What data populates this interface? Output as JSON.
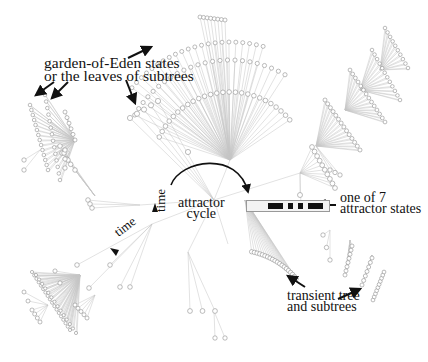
{
  "figure": {
    "type": "basin-of-attraction field (state transition graph)",
    "background": "#ffffff",
    "ink_color": "#111111",
    "node_color": "#9a9a9a",
    "edge_color": "#bdbdbd"
  },
  "labels": {
    "garden_of_eden": {
      "line1": "garden-of-Eden states",
      "line2": "or the leaves of subtrees"
    },
    "attractor_cycle": {
      "line1": "attractor",
      "line2": "cycle"
    },
    "attractor_state": {
      "line1": "one of 7",
      "line2": "attractor states"
    },
    "transient": {
      "line1": "transient tree",
      "line2": "and subtrees"
    },
    "time_vertical": "time",
    "time_diagonal": "time"
  },
  "attractor_state_pattern": {
    "cells": 16,
    "on": [
      4,
      5,
      6,
      8,
      10,
      12,
      13,
      14
    ]
  },
  "attractor_cycle": {
    "period": 7,
    "center": [
      214,
      200
    ]
  }
}
